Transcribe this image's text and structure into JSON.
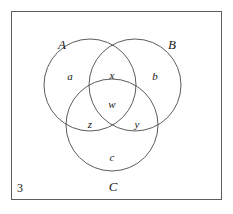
{
  "figure": {
    "number": "3",
    "frame_color": "#5d5d5d",
    "stroke_color": "#4a4a4a",
    "text_color": "#181818",
    "background": "#ffffff"
  },
  "diagram": {
    "type": "venn-3-set",
    "sets": [
      {
        "id": "A",
        "label": "A",
        "cx": 90,
        "cy": 85,
        "r": 46
      },
      {
        "id": "B",
        "label": "B",
        "cx": 135,
        "cy": 85,
        "r": 46
      },
      {
        "id": "C",
        "label": "C",
        "cx": 112,
        "cy": 125,
        "r": 46
      }
    ],
    "set_labels": [
      {
        "key": "A",
        "text": "A",
        "x": 62,
        "y": 44
      },
      {
        "key": "B",
        "text": "B",
        "x": 172,
        "y": 44
      },
      {
        "key": "C",
        "text": "C",
        "x": 113,
        "y": 186
      }
    ],
    "regions": [
      {
        "key": "a",
        "text": "a",
        "x": 70,
        "y": 76,
        "meaning": "A only"
      },
      {
        "key": "b",
        "text": "b",
        "x": 155,
        "y": 76,
        "meaning": "B only"
      },
      {
        "key": "c",
        "text": "c",
        "x": 112,
        "y": 157,
        "meaning": "C only"
      },
      {
        "key": "x",
        "text": "x",
        "x": 112,
        "y": 75,
        "meaning": "A and B only"
      },
      {
        "key": "w",
        "text": "w",
        "x": 112,
        "y": 104,
        "meaning": "A and B and C"
      },
      {
        "key": "z",
        "text": "z",
        "x": 90,
        "y": 124,
        "meaning": "A and C only"
      },
      {
        "key": "y",
        "text": "y",
        "x": 137,
        "y": 124,
        "meaning": "B and C only"
      }
    ]
  }
}
